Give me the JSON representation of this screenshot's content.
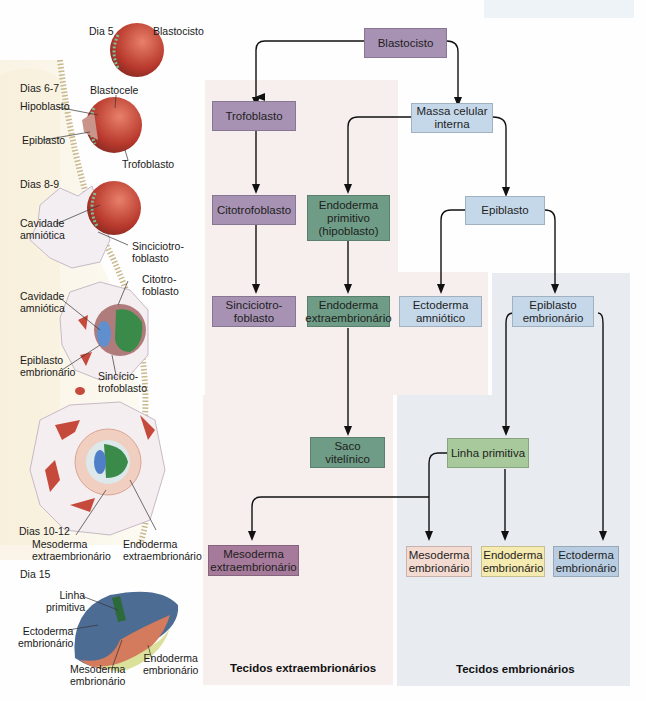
{
  "flowchart": {
    "nodes": {
      "blastocisto": "Blastocisto",
      "trofoblasto": "Trofoblasto",
      "massa_celular": "Massa celular\ninterna",
      "citotrofoblasto": "Citotrofoblasto",
      "endoderma_primitivo": "Endoderma\nprimitivo\n(hipoblasto)",
      "epiblasto": "Epiblasto",
      "sinciciotrofoblasto": "Sinciciotro-\nfoblasto",
      "endoderma_extra": "Endoderma\nextraembrionário",
      "ectoderma_amniotico": "Ectoderma\namniótico",
      "epiblasto_embrionario": "Epiblasto\nembrionário",
      "saco_vitelinico": "Saco\nvitelínico",
      "linha_primitiva": "Linha primitiva",
      "mesoderma_extra": "Mesoderma\nextraembrionário",
      "mesoderma_embrionario": "Mesoderma\nembrionário",
      "endoderma_embrionario": "Endoderma\nembrionário",
      "ectoderma_embrionario": "Ectoderma\nembrionário"
    },
    "regions": {
      "extra": "Tecidos extraembrionários",
      "embrio": "Tecidos embrionários"
    },
    "colors": {
      "purple": "#a792b3",
      "dark_purple": "#a57a9a",
      "green": "#6f9c86",
      "light_blue": "#c5d8ea",
      "light_green": "#a8c99b",
      "peach": "#f3dbd2",
      "yellow": "#f5eab0",
      "pink_region": "#f7eeee",
      "blue_region": "#e8ecf1"
    }
  },
  "illustration": {
    "labels": {
      "dia5": "Dia 5",
      "blastocisto": "Blastocisto",
      "dias67": "Dias 6-7",
      "blastocele": "Blastocele",
      "hipoblasto": "Hipoblasto",
      "epiblasto": "Epiblasto",
      "trofoblasto": "Trofoblasto",
      "dias89": "Dias 8-9",
      "cavidade1": "Cavidade\namniótica",
      "sinciciotrofoblasto1": "Sinciciotro-\nfoblasto",
      "citotrofoblasto": "Citotro-\nfoblasto",
      "cavidade2": "Cavidade\namniótica",
      "epiblasto_emb": "Epiblasto\nembrionário",
      "sinciciotrofoblasto2": "Sincício-\ntrofoblasto",
      "dias1012": "Dias 10-12",
      "mesoderma_extra": "Mesoderma\nextraembrionário",
      "endoderma_extra": "Endoderma\nextraembrionário",
      "dia15": "Dia 15",
      "linha_primitiva": "Linha\nprimitiva",
      "ectoderma_emb": "Ectoderma\nembrionário",
      "mesoderma_emb": "Mesoderma\nembrionário",
      "endoderma_emb": "Endoderma\nembrionário"
    }
  }
}
